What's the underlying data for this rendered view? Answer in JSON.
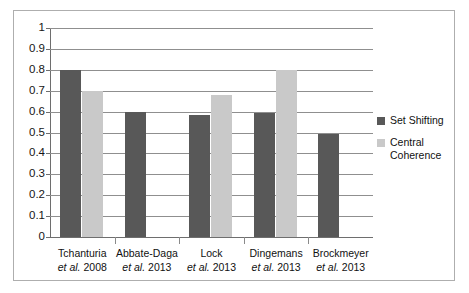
{
  "chart_data": {
    "type": "bar",
    "title": "",
    "subtitle": "",
    "xlabel": "",
    "ylabel": "",
    "ylim": [
      0,
      1
    ],
    "yticks": [
      0,
      0.1,
      0.2,
      0.3,
      0.4,
      0.5,
      0.6,
      0.7,
      0.8,
      0.9,
      1
    ],
    "ytick_labels": [
      "0",
      "0.1",
      "0.2",
      "0.3",
      "0.4",
      "0.5",
      "0.6",
      "0.7",
      "0.8",
      "0.9",
      "1"
    ],
    "grid": true,
    "legend_position": "right",
    "categories": [
      "Tchanturia et al. 2008",
      "Abbate-Daga et al. 2013",
      "Lock et al. 2013",
      "Dingemans et al. 2013",
      "Brockmeyer et al. 2013"
    ],
    "category_lines": [
      {
        "author": "Tchanturia",
        "citation": "et al. 2008"
      },
      {
        "author": "Abbate-Daga",
        "citation": "et al. 2013"
      },
      {
        "author": "Lock",
        "citation": "et al. 2013"
      },
      {
        "author": "Dingemans",
        "citation": "et al. 2013"
      },
      {
        "author": "Brockmeyer",
        "citation": "et al. 2013"
      }
    ],
    "series": [
      {
        "name": "Set Shifting",
        "color": "#585858",
        "values": [
          0.8,
          0.6,
          0.585,
          0.595,
          0.495
        ]
      },
      {
        "name": "Central Coherence",
        "color": "#c9c9c9",
        "values": [
          0.7,
          null,
          0.68,
          0.8,
          null
        ]
      }
    ]
  },
  "legend": {
    "items": [
      {
        "label": "Set Shifting",
        "color": "#585858"
      },
      {
        "label": "Central Coherence",
        "color": "#c9c9c9"
      }
    ]
  },
  "colors": {
    "set_shifting": "#585858",
    "central_coherence": "#c9c9c9",
    "gridline": "#8f8f8f",
    "axis": "#6e6e6e",
    "frame": "#aeaeae",
    "text": "#111111"
  }
}
